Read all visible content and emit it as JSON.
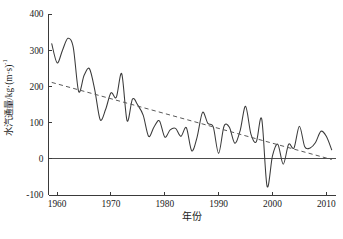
{
  "chart_data": {
    "type": "line",
    "title": "",
    "subtitle": "",
    "xlabel": "年份",
    "ylabel": "水汽通量/kg·(m·s)",
    "ylabel_exponent": "-1",
    "xlim": [
      1958.4,
      2011.8
    ],
    "ylim": [
      -100,
      400
    ],
    "xticks": [
      1960,
      1970,
      1980,
      1990,
      2000,
      2010
    ],
    "yticks": [
      -100,
      0,
      100,
      200,
      300,
      400
    ],
    "xtick_labels": [
      "1960",
      "1970",
      "1980",
      "1990",
      "2000",
      "2010"
    ],
    "ytick_labels": [
      "-100",
      "0",
      "100",
      "200",
      "300",
      "400"
    ],
    "grid": false,
    "legend": "none",
    "zero_reference_line": true,
    "series": [
      {
        "name": "水汽通量",
        "style": "solid",
        "color": "#3a3a3a",
        "x": [
          1959,
          1960,
          1961,
          1962,
          1963,
          1964,
          1965,
          1966,
          1967,
          1968,
          1969,
          1970,
          1971,
          1972,
          1973,
          1974,
          1975,
          1976,
          1977,
          1978,
          1979,
          1980,
          1981,
          1982,
          1983,
          1984,
          1985,
          1986,
          1987,
          1988,
          1989,
          1990,
          1991,
          1992,
          1993,
          1994,
          1995,
          1996,
          1997,
          1998,
          1999,
          2000,
          2001,
          2002,
          2003,
          2004,
          2005,
          2006,
          2007,
          2008,
          2009,
          2010,
          2011
        ],
        "values": [
          318,
          265,
          300,
          333,
          308,
          186,
          230,
          249,
          190,
          108,
          136,
          182,
          170,
          235,
          105,
          165,
          148,
          120,
          62,
          88,
          105,
          60,
          80,
          84,
          62,
          86,
          22,
          60,
          128,
          98,
          88,
          15,
          90,
          87,
          43,
          78,
          145,
          68,
          47,
          110,
          -76,
          8,
          40,
          -15,
          40,
          30,
          90,
          33,
          30,
          45,
          76,
          62,
          25
        ]
      },
      {
        "name": "线性趋势",
        "style": "dashed",
        "color": "#5a5a5a",
        "x": [
          1959,
          2011
        ],
        "values": [
          211,
          -2
        ]
      }
    ]
  }
}
